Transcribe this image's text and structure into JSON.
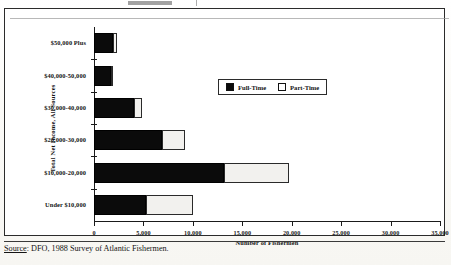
{
  "figure": {
    "source_prefix": "Source",
    "source_text": ": DFO, 1988 Survey of Atlantic Fishermen."
  },
  "legend": {
    "items": [
      {
        "label": "Full-Time",
        "color": "#0b0b0b",
        "icon": "filled-square-icon"
      },
      {
        "label": "Part-Time",
        "color": "#ffffff",
        "icon": "empty-square-icon"
      }
    ]
  },
  "chart_data": {
    "type": "bar",
    "orientation": "horizontal",
    "stacked": true,
    "title": "",
    "xlabel": "Number of Fishermen",
    "ylabel": "Total Net Income, All Sources",
    "categories": [
      "Under $10,000",
      "$10,000-20,000",
      "$20,000-30,000",
      "$30,000-40,000",
      "$40,000-50,000",
      "$50,000 Plus"
    ],
    "series": [
      {
        "name": "Full-Time",
        "color": "#0b0b0b",
        "values": [
          5300,
          13200,
          6900,
          4000,
          1700,
          1900
        ]
      },
      {
        "name": "Part-Time",
        "color": "#ffffff",
        "values": [
          4700,
          6500,
          2300,
          900,
          200,
          400
        ]
      }
    ],
    "totals": [
      10000,
      19700,
      9200,
      4900,
      1900,
      2300
    ],
    "xlim": [
      0,
      35000
    ],
    "xticks": [
      0,
      5000,
      10000,
      15000,
      20000,
      25000,
      30000,
      35000
    ],
    "xtick_labels": [
      "0",
      "5,000",
      "10,000",
      "15,000",
      "20,000",
      "25,000",
      "30,000",
      "35,000"
    ],
    "grid": false,
    "legend_position": "upper-right-inside"
  }
}
